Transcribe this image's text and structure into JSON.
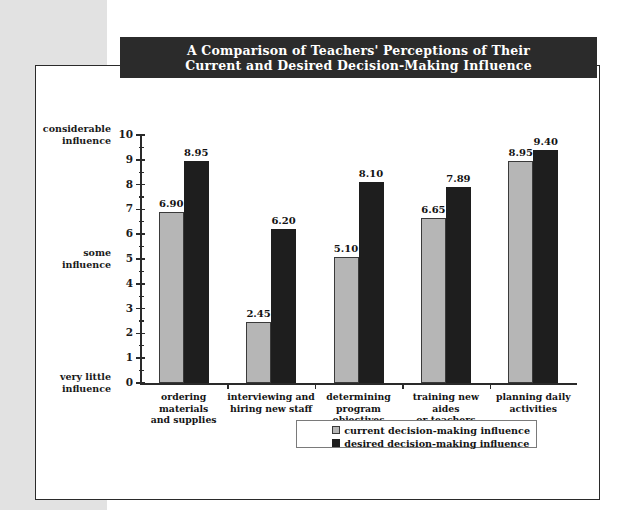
{
  "title": {
    "line1": "A Comparison of Teachers' Perceptions of Their",
    "line2": "Current and Desired Decision-Making Influence"
  },
  "colors": {
    "banner_bg": "#2b2b2b",
    "banner_text": "#ffffff",
    "page_bg": "#ffffff",
    "margin_strip": "#e2e2e2",
    "current_series": "#b6b6b6",
    "desired_series": "#1e1e1e",
    "axis": "#2a2a2a"
  },
  "axis_annotations": [
    {
      "line1": "considerable",
      "line2": "influence",
      "at_value": 10
    },
    {
      "line1": "some",
      "line2": "influence",
      "at_value": 5
    },
    {
      "line1": "very little",
      "line2": "influence",
      "at_value": 0
    }
  ],
  "legend": {
    "items": [
      {
        "label": "current decision-making influence",
        "swatch": "current"
      },
      {
        "label": "desired decision-making influence",
        "swatch": "desired"
      }
    ]
  },
  "chart_data": {
    "type": "bar",
    "title": "A Comparison of Teachers' Perceptions of Their Current and Desired Decision-Making Influence",
    "xlabel": "",
    "ylabel": "",
    "ylim": [
      0,
      10
    ],
    "ytick_labels": [
      "0",
      "1",
      "2",
      "3",
      "4",
      "5",
      "6",
      "7",
      "8",
      "9",
      "10"
    ],
    "yticks": [
      0,
      1,
      2,
      3,
      4,
      5,
      6,
      7,
      8,
      9,
      10
    ],
    "yminor_step": 0.5,
    "grid": false,
    "legend_position": "bottom-right",
    "categories": [
      "ordering materials and supplies",
      "interviewing and hiring new staff",
      "determining program objectives",
      "training new aides or teachers",
      "planning daily activities"
    ],
    "category_lines": [
      [
        "ordering materials",
        "and supplies"
      ],
      [
        "interviewing and",
        "hiring new staff"
      ],
      [
        "determining program",
        "objectives"
      ],
      [
        "training new aides",
        "or teachers"
      ],
      [
        "planning daily",
        "activities"
      ]
    ],
    "series": [
      {
        "name": "current decision-making influence",
        "values": [
          6.9,
          2.45,
          5.1,
          6.65,
          8.95
        ],
        "labels": [
          "6.90",
          "2.45",
          "5.10",
          "6.65",
          "8.95"
        ]
      },
      {
        "name": "desired decision-making influence",
        "values": [
          8.95,
          6.2,
          8.1,
          7.89,
          9.4
        ],
        "labels": [
          "8.95",
          "6.20",
          "8.10",
          "7.89",
          "9.40"
        ]
      }
    ]
  }
}
